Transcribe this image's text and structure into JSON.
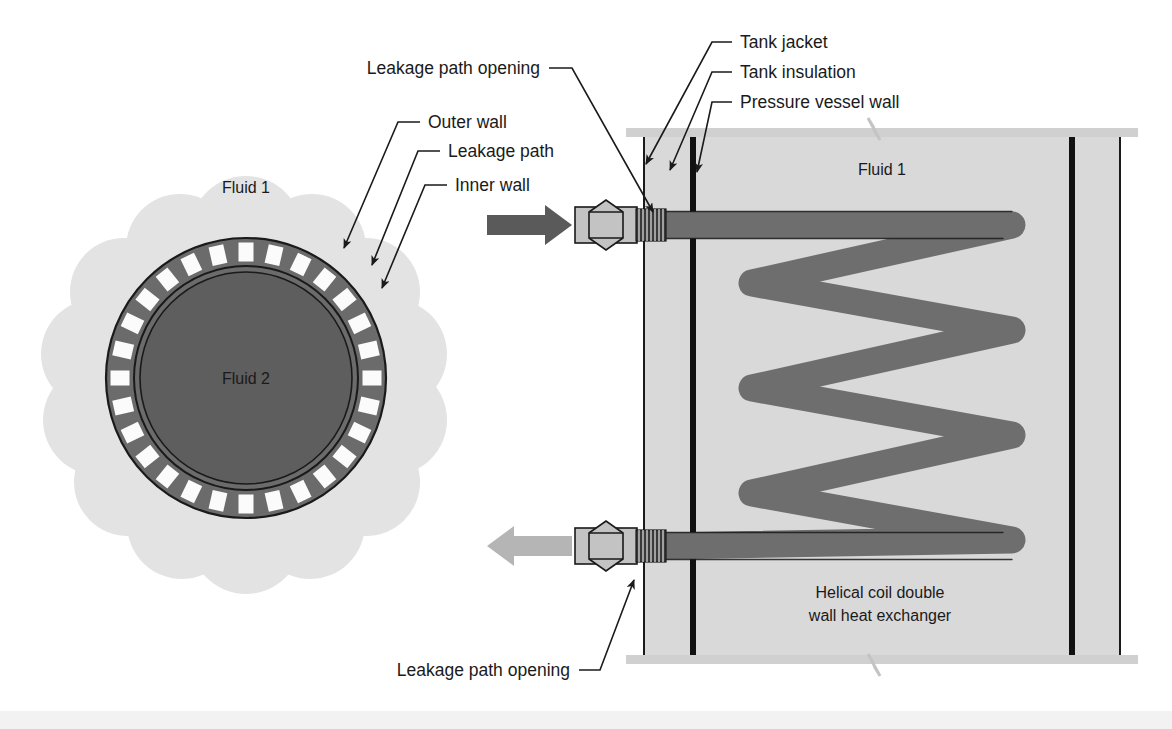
{
  "figure": {
    "background_color": "#ffffff"
  },
  "colors": {
    "cloud_fill": "#e3e3e3",
    "ring_fill": "#6b6b6b",
    "core_fill": "#5e5e5e",
    "gap_fill": "#fbfbfb",
    "tank_fill": "#d9d9d9",
    "coil_fill": "#6e6e6e",
    "wall_dark": "#111111",
    "arrow_dark": "#5a5a5a",
    "arrow_light": "#b5b5b5",
    "fitting_fill": "#c3c3c3",
    "band_gray": "#d0d0d0",
    "outline": "#1a1a1a",
    "bottom_band": "#f2f2f3"
  },
  "cross_section": {
    "fluid_outer_label": "Fluid 1",
    "fluid_inner_label": "Fluid 2",
    "leakage_gap_count": 28
  },
  "tank_view": {
    "fluid_label": "Fluid 1",
    "exchanger_label_line1": "Helical coil double",
    "exchanger_label_line2": "wall heat exchanger",
    "coil_turns": 5
  },
  "labels": {
    "leakage_path_opening_top": "Leakage path opening",
    "leakage_path_opening_bottom": "Leakage path opening",
    "outer_wall": "Outer wall",
    "leakage_path": "Leakage path",
    "inner_wall": "Inner wall",
    "tank_jacket": "Tank jacket",
    "tank_insulation": "Tank insulation",
    "pressure_vessel_wall": "Pressure vessel wall"
  },
  "flow": {
    "inlet_direction": "right",
    "outlet_direction": "left"
  }
}
